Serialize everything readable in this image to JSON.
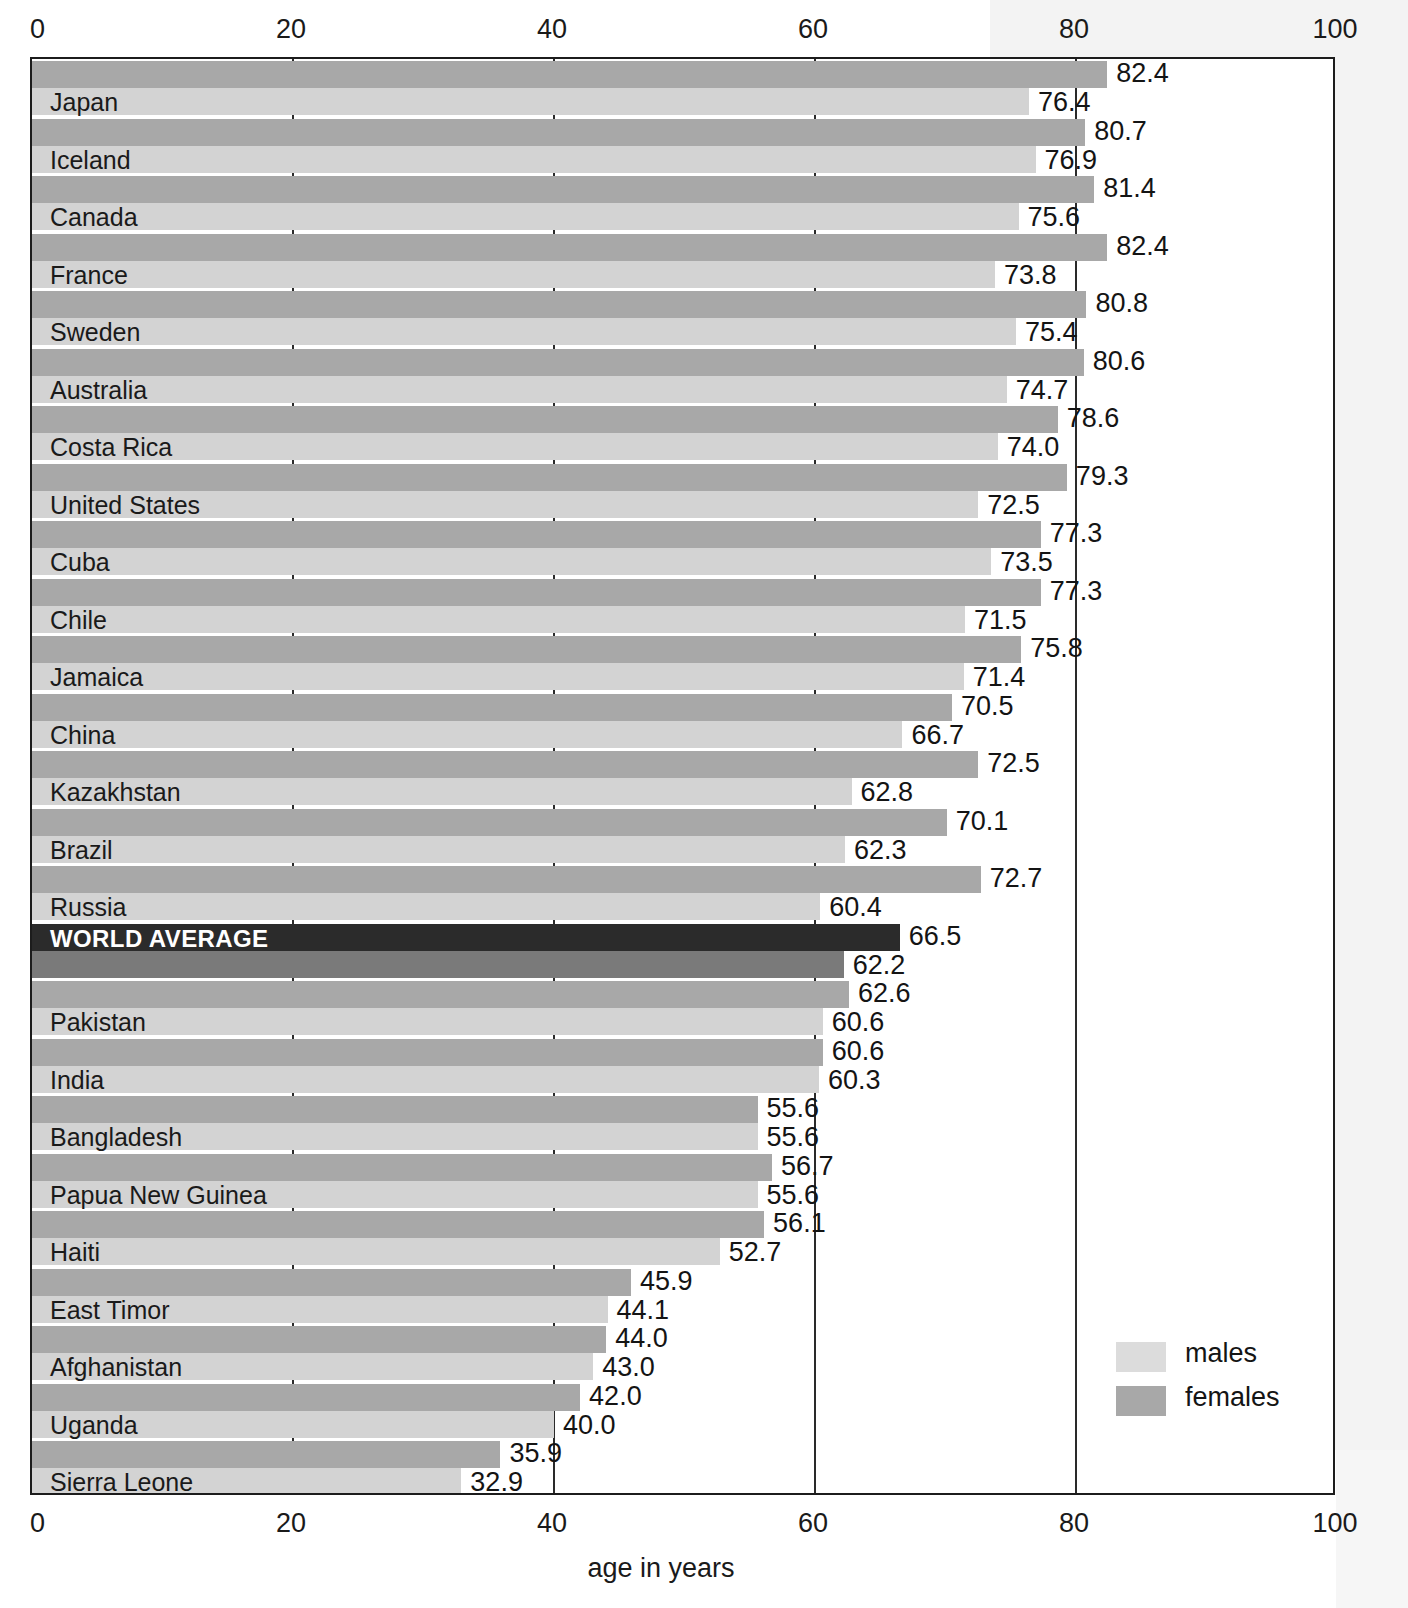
{
  "chart_data": {
    "type": "bar",
    "orientation": "horizontal",
    "title": "",
    "xlabel": "age in years",
    "ylabel": "",
    "xlim": [
      0,
      100
    ],
    "xticks": [
      "0",
      "20",
      "40",
      "60",
      "80",
      "100"
    ],
    "grid": true,
    "legend_position": "bottom-right",
    "series": [
      {
        "name": "males",
        "color": "#d3d3d3",
        "values": [
          76.4,
          76.9,
          75.6,
          73.8,
          75.4,
          74.7,
          74.0,
          72.5,
          73.5,
          71.5,
          71.4,
          66.7,
          62.8,
          62.3,
          60.4,
          62.2,
          60.6,
          60.3,
          55.6,
          55.6,
          52.7,
          44.1,
          43.0,
          40.0,
          32.9
        ]
      },
      {
        "name": "females",
        "color": "#a8a8a8",
        "values": [
          82.4,
          80.7,
          81.4,
          82.4,
          80.8,
          80.6,
          78.6,
          79.3,
          77.3,
          77.3,
          75.8,
          70.5,
          72.5,
          70.1,
          72.7,
          66.5,
          62.6,
          60.6,
          55.6,
          56.7,
          56.1,
          45.9,
          44.0,
          42.0,
          35.9
        ]
      }
    ],
    "categories": [
      "Japan",
      "Iceland",
      "Canada",
      "France",
      "Sweden",
      "Australia",
      "Costa Rica",
      "United States",
      "Cuba",
      "Chile",
      "Jamaica",
      "China",
      "Kazakhstan",
      "Brazil",
      "Russia",
      "WORLD AVERAGE",
      "Pakistan",
      "India",
      "Bangladesh",
      "Papua New Guinea",
      "Haiti",
      "East Timor",
      "Afghanistan",
      "Uganda",
      "Sierra Leone"
    ],
    "highlight_category": "WORLD AVERAGE",
    "highlight_colors": {
      "females": "#2b2b2b",
      "males": "#7a7a7a"
    },
    "rows": [
      {
        "label": "Japan",
        "female": "82.4",
        "male": "76.4",
        "highlight": false
      },
      {
        "label": "Iceland",
        "female": "80.7",
        "male": "76.9",
        "highlight": false
      },
      {
        "label": "Canada",
        "female": "81.4",
        "male": "75.6",
        "highlight": false
      },
      {
        "label": "France",
        "female": "82.4",
        "male": "73.8",
        "highlight": false
      },
      {
        "label": "Sweden",
        "female": "80.8",
        "male": "75.4",
        "highlight": false
      },
      {
        "label": "Australia",
        "female": "80.6",
        "male": "74.7",
        "highlight": false
      },
      {
        "label": "Costa Rica",
        "female": "78.6",
        "male": "74.0",
        "highlight": false
      },
      {
        "label": "United States",
        "female": "79.3",
        "male": "72.5",
        "highlight": false
      },
      {
        "label": "Cuba",
        "female": "77.3",
        "male": "73.5",
        "highlight": false
      },
      {
        "label": "Chile",
        "female": "77.3",
        "male": "71.5",
        "highlight": false
      },
      {
        "label": "Jamaica",
        "female": "75.8",
        "male": "71.4",
        "highlight": false
      },
      {
        "label": "China",
        "female": "70.5",
        "male": "66.7",
        "highlight": false
      },
      {
        "label": "Kazakhstan",
        "female": "72.5",
        "male": "62.8",
        "highlight": false
      },
      {
        "label": "Brazil",
        "female": "70.1",
        "male": "62.3",
        "highlight": false
      },
      {
        "label": "Russia",
        "female": "72.7",
        "male": "60.4",
        "highlight": false
      },
      {
        "label": "WORLD AVERAGE",
        "female": "66.5",
        "male": "62.2",
        "highlight": true
      },
      {
        "label": "Pakistan",
        "female": "62.6",
        "male": "60.6",
        "highlight": false
      },
      {
        "label": "India",
        "female": "60.6",
        "male": "60.3",
        "highlight": false
      },
      {
        "label": "Bangladesh",
        "female": "55.6",
        "male": "55.6",
        "highlight": false
      },
      {
        "label": "Papua New Guinea",
        "female": "56.7",
        "male": "55.6",
        "highlight": false
      },
      {
        "label": "Haiti",
        "female": "56.1",
        "male": "52.7",
        "highlight": false
      },
      {
        "label": "East Timor",
        "female": "45.9",
        "male": "44.1",
        "highlight": false
      },
      {
        "label": "Afghanistan",
        "female": "44.0",
        "male": "43.0",
        "highlight": false
      },
      {
        "label": "Uganda",
        "female": "42.0",
        "male": "40.0",
        "highlight": false
      },
      {
        "label": "Sierra Leone",
        "female": "35.9",
        "male": "32.9",
        "highlight": false
      }
    ],
    "legend": [
      {
        "key": "males",
        "label": "males",
        "color": "#d3d3d3"
      },
      {
        "key": "females",
        "label": "females",
        "color": "#a8a8a8"
      }
    ]
  }
}
